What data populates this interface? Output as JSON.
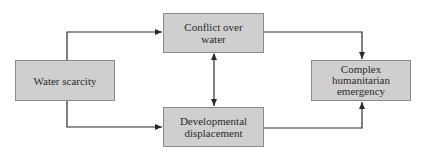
{
  "diagram": {
    "nodes": {
      "water_scarcity": {
        "lines": [
          "Water scarcity"
        ]
      },
      "conflict": {
        "lines": [
          "Conflict over",
          "water"
        ]
      },
      "displacement": {
        "lines": [
          "Developmental",
          "displacement"
        ]
      },
      "emergency": {
        "lines": [
          "Complex",
          "humanitarian",
          "emergency"
        ]
      }
    },
    "edges": [
      {
        "from": "water_scarcity",
        "to": "conflict",
        "direction": "forward"
      },
      {
        "from": "water_scarcity",
        "to": "displacement",
        "direction": "forward"
      },
      {
        "from": "conflict",
        "to": "displacement",
        "direction": "bidirectional"
      },
      {
        "from": "conflict",
        "to": "emergency",
        "direction": "forward"
      },
      {
        "from": "displacement",
        "to": "emergency",
        "direction": "forward"
      }
    ],
    "colors": {
      "box_fill": "#cfcfcf",
      "box_border": "#8a8a8a",
      "line": "#2a2a2a"
    }
  }
}
